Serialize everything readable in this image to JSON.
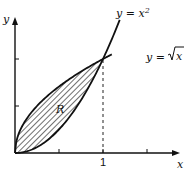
{
  "chart_data": {
    "type": "line",
    "title": "",
    "xlabel": "x",
    "ylabel": "y",
    "xlim": [
      0,
      1.25
    ],
    "ylim": [
      0,
      1.4
    ],
    "x_ticks": [
      0.5,
      1,
      1.5
    ],
    "x_tick_labels": [
      "",
      "1",
      ""
    ],
    "y_ticks": [
      0.5,
      1
    ],
    "y_tick_labels": [
      "",
      ""
    ],
    "grid": false,
    "series": [
      {
        "name": "y = x²",
        "label": "y = x",
        "superscript": "2",
        "function": "x^2",
        "x_range": [
          0,
          1.19
        ]
      },
      {
        "name": "y = √x",
        "label": "y = ",
        "radicand": "x",
        "function": "sqrt(x)",
        "x_range": [
          0,
          1.1
        ]
      }
    ],
    "region": {
      "label": "R",
      "between": [
        "sqrt(x)",
        "x^2"
      ],
      "x_range": [
        0,
        1
      ],
      "fill": "hatched"
    },
    "annotations": [
      {
        "type": "dashed-vertical",
        "x": 1,
        "from_y": 0,
        "to_y": 1
      }
    ],
    "intersection": [
      1,
      1
    ]
  }
}
